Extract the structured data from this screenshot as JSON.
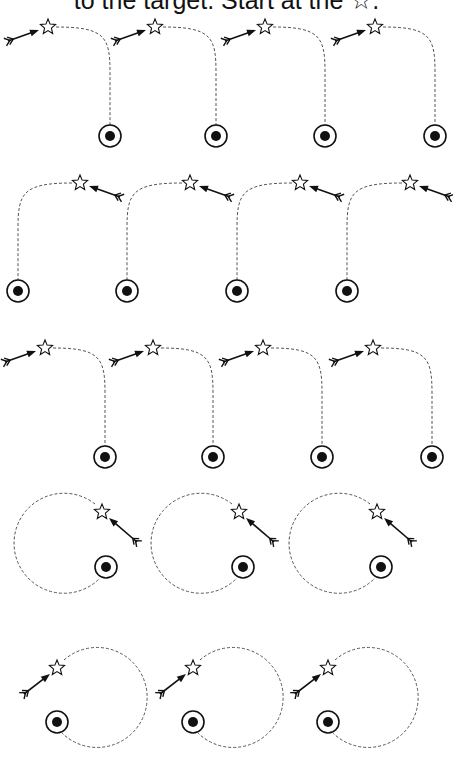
{
  "worksheet": {
    "instruction_text": "to the target. Start at the ☆.",
    "colors": {
      "ink": "#111111",
      "path": "#555555",
      "background": "#ffffff"
    },
    "rows": [
      {
        "pattern": "hook-right",
        "count": 4
      },
      {
        "pattern": "hook-left",
        "count": 4
      },
      {
        "pattern": "hook-right",
        "count": 4
      },
      {
        "pattern": "loop-arrow-from-right",
        "count": 3
      },
      {
        "pattern": "loop-arrow-from-left",
        "count": 3
      }
    ],
    "icons": {
      "start": "star-icon",
      "end": "target-icon",
      "pointer": "arrow-icon"
    }
  }
}
